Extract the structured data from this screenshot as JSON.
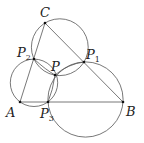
{
  "diagram": {
    "type": "geometry",
    "stroke_color": "#555555",
    "point_color": "#111111",
    "points": {
      "A": {
        "x": 20,
        "y": 102,
        "label": "A",
        "sub": ""
      },
      "B": {
        "x": 123,
        "y": 102,
        "label": "B",
        "sub": ""
      },
      "C": {
        "x": 45,
        "y": 23,
        "label": "C",
        "sub": ""
      },
      "P": {
        "x": 55,
        "y": 75,
        "label": "P",
        "sub": ""
      },
      "P1": {
        "x": 84,
        "y": 62,
        "label": "P",
        "sub": "1"
      },
      "P2": {
        "x": 34,
        "y": 59,
        "label": "P",
        "sub": "2"
      },
      "P3": {
        "x": 48,
        "y": 102,
        "label": "P",
        "sub": "3"
      }
    },
    "segments": [
      [
        "A",
        "B"
      ],
      [
        "B",
        "C"
      ],
      [
        "C",
        "A"
      ]
    ],
    "circles": [
      {
        "name": "circle-C-P2-P1",
        "cx": 59.8,
        "cy": 47.2,
        "r": 28.4
      },
      {
        "name": "circle-A-P2-P3",
        "cx": 34,
        "cy": 82.8,
        "r": 23.7
      },
      {
        "name": "circle-B-P1-P3",
        "cx": 85.5,
        "cy": 99.5,
        "r": 37.6
      }
    ],
    "lens_arcs": [
      {
        "name": "arc-P2-P",
        "from": "P2",
        "to": "P"
      },
      {
        "name": "arc-P-P1",
        "from": "P",
        "to": "P1"
      },
      {
        "name": "arc-P-P3",
        "from": "P",
        "to": "P3"
      }
    ]
  }
}
